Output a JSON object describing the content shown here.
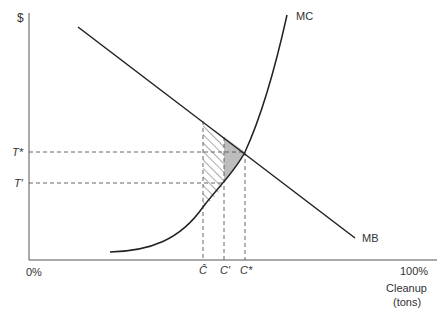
{
  "diagram": {
    "y_axis_label": "$",
    "x_axis_label_line1": "Cleanup",
    "x_axis_label_line2": "(tons)",
    "x_min_label": "0%",
    "x_max_label": "100%",
    "curves": {
      "mc_label": "MC",
      "mb_label": "MB"
    },
    "price_levels": {
      "t_star": "T*",
      "t_prime": "T′"
    },
    "quantity_levels": {
      "c_hat": "Ĉ",
      "c_prime": "C′",
      "c_star": "C*"
    },
    "regions": {
      "hatched": "hatched area between Ĉ and C′ under MB above MC",
      "shaded": "gray shaded triangle between C′ and C* under MB above MC"
    },
    "colors": {
      "line": "#222222",
      "axis": "#555555",
      "shade": "#bdbdbd"
    }
  }
}
